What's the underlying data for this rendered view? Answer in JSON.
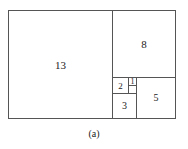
{
  "diagram": {
    "type": "fibonacci-rectangle-tiling",
    "squares": [
      {
        "label": "13",
        "x": 8,
        "y": 10,
        "w": 105,
        "h": 109,
        "font": 11
      },
      {
        "label": "8",
        "x": 112,
        "y": 10,
        "w": 64,
        "h": 68,
        "font": 11
      },
      {
        "label": "2",
        "x": 112,
        "y": 77,
        "w": 17,
        "h": 17,
        "font": 9
      },
      {
        "label": "1",
        "x": 128,
        "y": 77,
        "w": 9,
        "h": 9,
        "font": 8
      },
      {
        "label": "",
        "x": 128,
        "y": 85,
        "w": 9,
        "h": 9,
        "font": 8
      },
      {
        "label": "3",
        "x": 112,
        "y": 93,
        "w": 25,
        "h": 26,
        "font": 10
      },
      {
        "label": "5",
        "x": 136,
        "y": 77,
        "w": 40,
        "h": 42,
        "font": 10
      }
    ],
    "caption": "(a)"
  }
}
